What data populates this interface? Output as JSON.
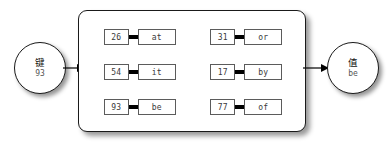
{
  "diagram": {
    "key_node": {
      "label": "键",
      "value": "93",
      "icon": "circle-node"
    },
    "value_node": {
      "label": "值",
      "value": "be",
      "icon": "circle-node"
    },
    "arrows": {
      "in": "arrow-right-icon",
      "out": "arrow-right-icon"
    },
    "entries": [
      {
        "key": "26",
        "value": "at"
      },
      {
        "key": "31",
        "value": "or"
      },
      {
        "key": "54",
        "value": "it"
      },
      {
        "key": "17",
        "value": "by"
      },
      {
        "key": "93",
        "value": "be"
      },
      {
        "key": "77",
        "value": "of"
      }
    ],
    "colors": {
      "stroke": "#1a1a1a",
      "cell_border": "#5b5b5b",
      "link_bar": "#000000",
      "background": "#ffffff",
      "text": "#3a3a3a"
    }
  }
}
